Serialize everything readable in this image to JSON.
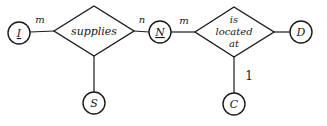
{
  "diagram": {
    "type": "er-diagram",
    "entities": [
      {
        "id": "I",
        "label": "I",
        "underlined": true
      },
      {
        "id": "N",
        "label": "N",
        "underlined": true
      },
      {
        "id": "S",
        "label": "S",
        "underlined": false
      },
      {
        "id": "D",
        "label": "D",
        "underlined": false
      },
      {
        "id": "C",
        "label": "C",
        "underlined": false
      }
    ],
    "relationships": [
      {
        "id": "supplies",
        "label": "supplies"
      },
      {
        "id": "located",
        "label_lines": [
          "is",
          "located",
          "at"
        ]
      }
    ],
    "cardinalities": {
      "i_supplies": "m",
      "supplies_n": "n",
      "n_located": "m",
      "located_c": "1"
    }
  }
}
